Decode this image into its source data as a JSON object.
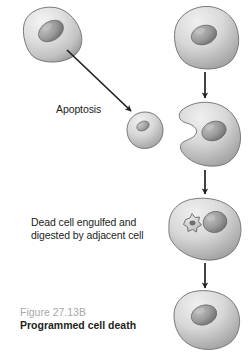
{
  "figure": {
    "background_color": "#ffffff",
    "number": "Figure 27.13B",
    "number_color": "#a6a8ab",
    "title": "Programmed cell death",
    "title_color": "#231f20"
  },
  "labels": {
    "apoptosis": "Apoptosis",
    "engulf_line1": "Dead cell engulfed and",
    "engulf_line2": "digested by adjacent cell",
    "text_color": "#231f20"
  },
  "diagram": {
    "cell_fill": "#d9d9d9",
    "cell_shadow": "#8e8e8e",
    "cell_highlight": "#f2f2f2",
    "nucleus_fill": "#9a9a9a",
    "nucleus_shadow": "#7a7a7a",
    "outline_color": "#5f5f5f",
    "arrow_color": "#231f20",
    "cells": [
      {
        "name": "healthy-cell-top-left",
        "shape": "triangular-blob",
        "description": "Living cell before apoptosis"
      },
      {
        "name": "healthy-cell-top-right",
        "shape": "rounded-blob",
        "description": "Adjacent living cell"
      },
      {
        "name": "apoptotic-cell",
        "shape": "round-small-blob",
        "description": "Shrunken dead cell after apoptosis"
      },
      {
        "name": "engulfing-cell",
        "shape": "crescent-blob",
        "description": "Adjacent cell wrapping around dead cell"
      },
      {
        "name": "digesting-cell",
        "shape": "rounded-blob-with-vesicle",
        "description": "Cell digesting engulfed dead cell"
      },
      {
        "name": "final-cell",
        "shape": "rounded-blob",
        "description": "Adjacent cell after digestion"
      }
    ],
    "arrows": [
      {
        "name": "apoptosis-arrow",
        "direction": "diagonal-down-right"
      },
      {
        "name": "engulf-arrow-1",
        "direction": "down"
      },
      {
        "name": "engulf-arrow-2",
        "direction": "down"
      },
      {
        "name": "engulf-arrow-3",
        "direction": "down"
      }
    ]
  }
}
